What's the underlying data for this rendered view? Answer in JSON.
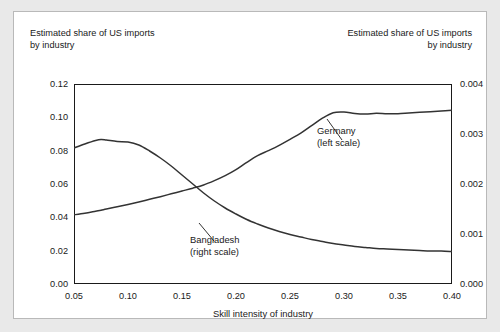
{
  "figure": {
    "left_caption": "Estimated share of US imports\nby industry",
    "right_caption": "Estimated share of US imports\nby industry"
  },
  "annotations": {
    "germany": "Germany\n(left scale)",
    "bangladesh": "Bangladesh\n(right scale)"
  },
  "colors": {
    "line": "#333333",
    "axis": "#1a1a1a",
    "panel_background": "#ffffff",
    "page_background": "#e9e9e9",
    "panel_border": "#b9b9b9"
  },
  "chart_data": {
    "type": "line",
    "title": "",
    "subtitle": "",
    "xlabel": "Skill intensity of industry",
    "ylabel": "Estimated share of US imports by industry",
    "y2label": "Estimated share of US imports by industry",
    "xlim": [
      0.05,
      0.4
    ],
    "ylim": [
      0.0,
      0.12
    ],
    "y2lim": [
      0.0,
      0.004
    ],
    "xticks": [
      0.05,
      0.1,
      0.15,
      0.2,
      0.25,
      0.3,
      0.35,
      0.4
    ],
    "xticklabels": [
      "0.05",
      "0.10",
      "0.15",
      "0.20",
      "0.25",
      "0.30",
      "0.35",
      "0.40"
    ],
    "yticks": [
      0.0,
      0.02,
      0.04,
      0.06,
      0.08,
      0.1,
      0.12
    ],
    "yticklabels": [
      "0.00",
      "0.02",
      "0.04",
      "0.06",
      "0.08",
      "0.10",
      "0.12"
    ],
    "y2ticks": [
      0.0,
      0.001,
      0.002,
      0.003,
      0.004
    ],
    "y2ticklabels": [
      "0.000",
      "0.001",
      "0.002",
      "0.003",
      "0.004"
    ],
    "grid": false,
    "legend": "annotations",
    "x": [
      0.05,
      0.06,
      0.07,
      0.075,
      0.08,
      0.09,
      0.1,
      0.11,
      0.12,
      0.13,
      0.14,
      0.15,
      0.16,
      0.17,
      0.18,
      0.19,
      0.2,
      0.21,
      0.22,
      0.23,
      0.24,
      0.25,
      0.26,
      0.27,
      0.28,
      0.29,
      0.3,
      0.31,
      0.32,
      0.33,
      0.34,
      0.35,
      0.36,
      0.37,
      0.38,
      0.39,
      0.4
    ],
    "series": [
      {
        "name": "Germany",
        "axis": "left",
        "scale_note": "left scale",
        "values": [
          0.0415,
          0.0425,
          0.0437,
          0.0443,
          0.045,
          0.0463,
          0.0477,
          0.0492,
          0.0508,
          0.0524,
          0.0541,
          0.0558,
          0.0575,
          0.0594,
          0.062,
          0.065,
          0.0686,
          0.073,
          0.077,
          0.08,
          0.0832,
          0.0868,
          0.0905,
          0.095,
          0.0995,
          0.1028,
          0.1032,
          0.1023,
          0.102,
          0.1024,
          0.1021,
          0.1022,
          0.1026,
          0.103,
          0.1034,
          0.1038,
          0.1042
        ]
      },
      {
        "name": "Bangladesh",
        "axis": "right",
        "scale_note": "right scale",
        "values": [
          0.00272,
          0.0028,
          0.00287,
          0.00289,
          0.00288,
          0.00285,
          0.00284,
          0.00278,
          0.00266,
          0.00252,
          0.00236,
          0.00218,
          0.002,
          0.00182,
          0.00166,
          0.00152,
          0.0014,
          0.00129,
          0.0012,
          0.00112,
          0.00105,
          0.00099,
          0.00094,
          0.00089,
          0.00085,
          0.00081,
          0.00078,
          0.00075,
          0.00073,
          0.00071,
          0.0007,
          0.00069,
          0.00068,
          0.00067,
          0.00066,
          0.00066,
          0.00065
        ]
      }
    ]
  }
}
